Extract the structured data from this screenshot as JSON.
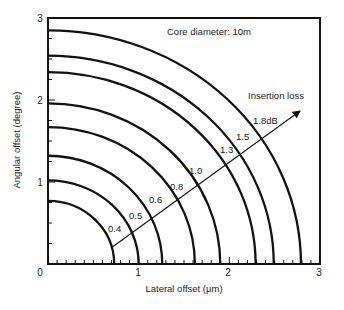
{
  "chart_data": {
    "type": "line",
    "title": "",
    "annotation": "Core diameter: 10m",
    "xlabel": "Lateral offset (µm)",
    "ylabel": "Angular offset (degree)",
    "xlim": [
      0,
      3
    ],
    "ylim": [
      0,
      3
    ],
    "x_ticks": [
      "0",
      "1",
      "2",
      "3"
    ],
    "y_ticks": [
      "0",
      "1",
      "2",
      "3"
    ],
    "x_minor_tick_step": 0.1,
    "y_minor_tick_step": 0.25,
    "grid": false,
    "legend": null,
    "arrow": {
      "label": "Insertion loss",
      "from": [
        0.7,
        0.2
      ],
      "to": [
        2.76,
        1.89
      ]
    },
    "series": [
      {
        "name": "0.4",
        "label": "0.4",
        "x_intercept": 0.73,
        "y_intercept": 0.77
      },
      {
        "name": "0.5",
        "label": "0.5",
        "x_intercept": 1.0,
        "y_intercept": 1.02
      },
      {
        "name": "0.6",
        "label": "0.6",
        "x_intercept": 1.26,
        "y_intercept": 1.32
      },
      {
        "name": "0.8",
        "label": "0.8",
        "x_intercept": 1.62,
        "y_intercept": 1.67
      },
      {
        "name": "1.0",
        "label": "1.0",
        "x_intercept": 1.9,
        "y_intercept": 1.96
      },
      {
        "name": "1.3",
        "label": "1.3",
        "x_intercept": 2.29,
        "y_intercept": 2.34
      },
      {
        "name": "1.5",
        "label": "1.5",
        "x_intercept": 2.49,
        "y_intercept": 2.54
      },
      {
        "name": "1.8",
        "label": "1.8dB",
        "x_intercept": 2.79,
        "y_intercept": 2.85
      }
    ],
    "units": {
      "insertion_loss": "dB"
    },
    "colors": {
      "line": "#111111",
      "text": "#222222",
      "background": "#ffffff"
    }
  }
}
